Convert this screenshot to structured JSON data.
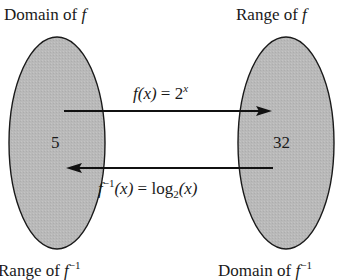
{
  "diagram": {
    "type": "function-mapping",
    "colors": {
      "ellipse_fill": "#b9b9b9",
      "ellipse_stroke": "#1a1a1a",
      "arrow": "#111111",
      "text": "#1a1a1a"
    },
    "left_set": {
      "top_label": {
        "prefix": "Domain of ",
        "func": "f",
        "sup": ""
      },
      "bottom_label": {
        "prefix": "Range of ",
        "func": "f",
        "sup": "−1"
      },
      "element": "5"
    },
    "right_set": {
      "top_label": {
        "prefix": "Range of ",
        "func": "f",
        "sup": ""
      },
      "bottom_label": {
        "prefix": "Domain of ",
        "func": "f",
        "sup": "−1"
      },
      "element": "32"
    },
    "forward_arrow": {
      "direction": "left-to-right",
      "label": {
        "f": "f",
        "arg": "(x)",
        "eq": " = 2",
        "exp": "x"
      }
    },
    "inverse_arrow": {
      "direction": "right-to-left",
      "label": {
        "f": "f",
        "sup": "−1",
        "arg": "(x)",
        "eq": " = log",
        "sub": "2",
        "tail": "(x)"
      }
    }
  }
}
